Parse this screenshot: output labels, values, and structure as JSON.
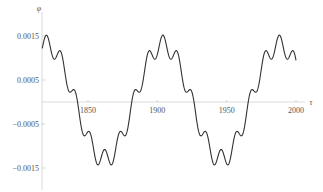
{
  "chart_data": {
    "type": "line",
    "title": "",
    "xlabel": "τ",
    "ylabel": "φ",
    "x_ticks": [
      1850,
      1900,
      1950,
      2000
    ],
    "x_tick_labels": [
      "1850",
      "1900",
      "1950",
      "2000"
    ],
    "y_ticks": [
      0.0015,
      0.0005,
      -0.0005,
      -0.0015
    ],
    "y_tick_labels": [
      "0.0015",
      "0.0005",
      "−0.0005",
      "−0.0015"
    ],
    "xlim": [
      1817,
      2000
    ],
    "ylim": [
      -0.0017,
      0.0017
    ],
    "grid": false,
    "legend": null,
    "series": [
      {
        "name": "φ(τ)",
        "description": "Slow sinusoid (period ≈ 84, amplitude ≈ 0.0013) with superimposed fast small oscillation (period ≈ 10.5, amplitude ≈ 0.00022)",
        "slow_amplitude": 0.0013,
        "slow_period": 84,
        "slow_peak_tau": 1820,
        "fast_amplitude": 0.00022,
        "fast_period": 10.5,
        "x": [
          1817,
          1830,
          1841,
          1862,
          1883,
          1903,
          1924,
          1945,
          1966,
          1988,
          2000
        ],
        "values": [
          0.0011,
          0.0011,
          0.0003,
          -0.0015,
          -0.0002,
          0.0015,
          0.0002,
          -0.0015,
          -0.0002,
          0.0015,
          0.0006
        ]
      }
    ],
    "line_color": "#333333"
  }
}
